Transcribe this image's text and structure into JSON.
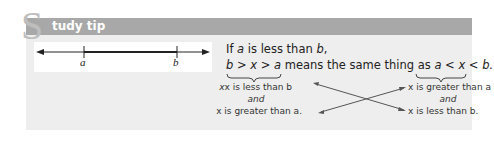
{
  "header": {
    "initial": "S",
    "title": "tudy tip"
  },
  "number_line": {
    "label_left": "a",
    "label_right": "b"
  },
  "statement": {
    "line1_prefix": "If ",
    "line1_a": "a",
    "line1_mid": " is less than ",
    "line1_b": "b",
    "line1_suffix": ",",
    "expr_left": "b > x > a",
    "middle_text": " means the same thing as ",
    "expr_right": "a < x < b."
  },
  "left_meaning": {
    "line1": "x is less than b",
    "line2": "and",
    "line3": "x is greater than a."
  },
  "right_meaning": {
    "line1": "x is greater than a",
    "line2": "and",
    "line3": "x is less than b."
  },
  "colors": {
    "header": "#a8a8a8",
    "panel": "#eeeeee",
    "initial": "#bdbdbd"
  }
}
